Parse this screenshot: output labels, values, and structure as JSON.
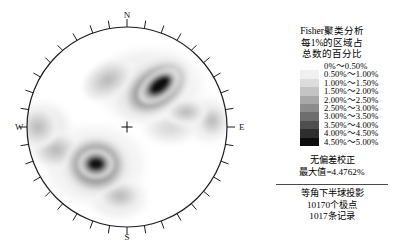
{
  "chart_data": {
    "type": "heatmap",
    "projection": "equal-angle lower-hemisphere stereonet",
    "title": "Fisher聚类分析",
    "subtitle_lines": [
      "每1%的区域占",
      "总数的百分比"
    ],
    "compass_labels": {
      "north": "N",
      "south": "S",
      "east": "E",
      "west": "W"
    },
    "center_marker": "+",
    "tick_interval_degrees": 10,
    "density_units": "% per 1% area",
    "max_density_percent": 4.4762,
    "total_poles": 10170,
    "total_records": 1017,
    "bias_correction": "none",
    "contour_levels": [
      0,
      0.5,
      1.0,
      1.5,
      2.0,
      2.5,
      3.0,
      3.5,
      4.0,
      4.5,
      5.0
    ],
    "clusters": [
      {
        "name": "primary-ne-cluster",
        "center_cx": 0.29,
        "center_cy": -0.33,
        "peak_percent": 4.48
      },
      {
        "name": "secondary-ssw-cluster",
        "center_cx": -0.19,
        "center_cy": 0.38,
        "peak_percent": 4.1
      },
      {
        "name": "minor-w-cluster",
        "center_cx": -0.82,
        "center_cy": 0.06,
        "peak_percent": 1.6
      },
      {
        "name": "minor-e-cluster",
        "center_cx": 0.8,
        "center_cy": -0.04,
        "peak_percent": 1.4
      }
    ]
  },
  "legend": {
    "title_line_1": "Fisher聚类分析",
    "title_line_2": "每1%的区域占",
    "title_line_3": "总数的百分比",
    "scale": [
      {
        "label": "0%～0.50%",
        "color": "#ffffff"
      },
      {
        "label": "0.50%～1.00%",
        "color": "#f0f0f0"
      },
      {
        "label": "1.00%～1.50%",
        "color": "#dcdcdc"
      },
      {
        "label": "1.50%～2.00%",
        "color": "#c4c4c4"
      },
      {
        "label": "2.00%～2.50%",
        "color": "#a8a8a8"
      },
      {
        "label": "2.50%～3.00%",
        "color": "#8c8c8c"
      },
      {
        "label": "3.00%～3.50%",
        "color": "#6e6e6e"
      },
      {
        "label": "3.50%～4.00%",
        "color": "#4f4f4f"
      },
      {
        "label": "4.00%～4.50%",
        "color": "#2e2e2e"
      },
      {
        "label": "4.50%～5.00%",
        "color": "#0d0d0d"
      }
    ],
    "note_bias": "无偏差校正",
    "note_max": "最大值=4.4762%",
    "note_projection": "等角下半球投影",
    "note_poles": "10170个极点",
    "note_records": "1017条记录"
  }
}
